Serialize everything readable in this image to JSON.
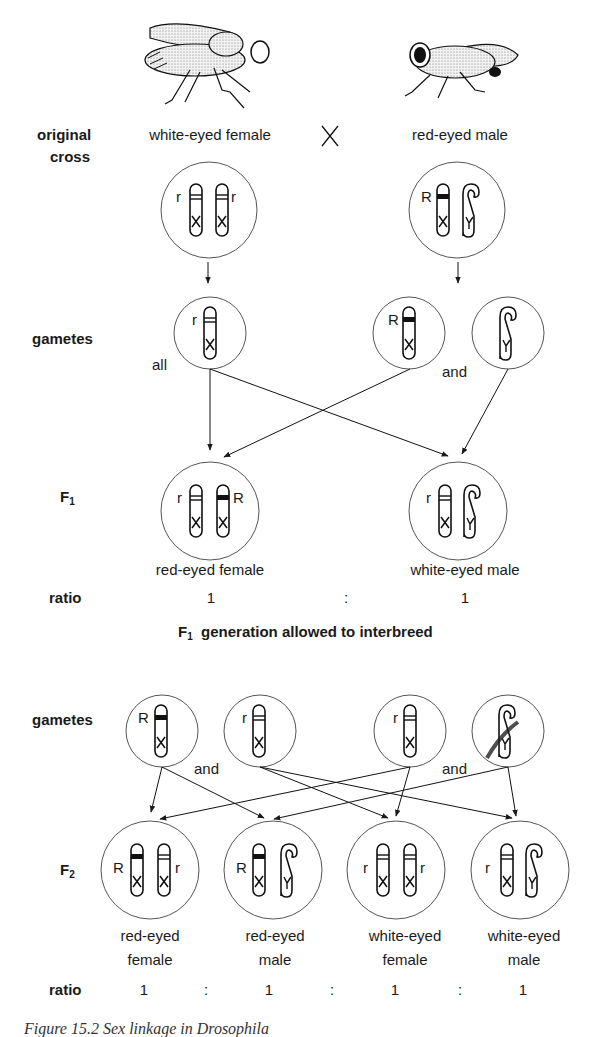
{
  "row_labels": {
    "original_cross": [
      "original",
      "cross"
    ],
    "gametes_1": "gametes",
    "f1": "F",
    "f1_sub": "1",
    "ratio_1": "ratio",
    "gametes_2": "gametes",
    "f2": "F",
    "f2_sub": "2",
    "ratio_2": "ratio"
  },
  "parents": {
    "female": "white-eyed female",
    "cross_symbol": "X",
    "male": "red-eyed male"
  },
  "connectors": {
    "all": "all",
    "and_1": "and",
    "and_2": "and",
    "and_3": "and"
  },
  "f1": {
    "offspring": [
      "red-eyed female",
      "white-eyed male"
    ],
    "ratio": [
      "1",
      ":",
      "1"
    ]
  },
  "interbreed": {
    "prefix": "F",
    "sub": "1",
    "text": "generation allowed to interbreed"
  },
  "f2": {
    "offspring": [
      [
        "red-eyed",
        "female"
      ],
      [
        "red-eyed",
        "male"
      ],
      [
        "white-eyed",
        "female"
      ],
      [
        "white-eyed",
        "male"
      ]
    ],
    "ratio": [
      "1",
      ":",
      "1",
      ":",
      "1",
      ":",
      "1"
    ]
  },
  "alleles": {
    "dominant": "R",
    "recessive": "r",
    "x": "X",
    "y": "Y"
  },
  "caption": "Figure 15.2   Sex linkage in Drosophila"
}
